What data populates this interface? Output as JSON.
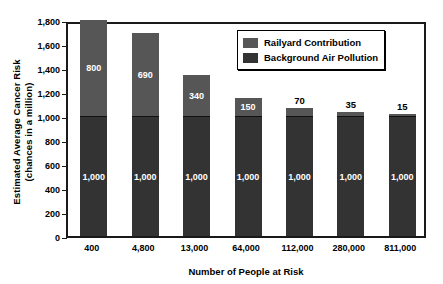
{
  "chart_data": {
    "type": "bar",
    "subtype": "stacked-vertical",
    "title": "",
    "xlabel": "Number of People at Risk",
    "ylabel": "Estimated Average Cancer Risk (chances in a million)",
    "ylabel_line1": "Estimated Average Cancer Risk",
    "ylabel_line2": "(chances in a million)",
    "categories": [
      "400",
      "4,800",
      "13,000",
      "64,000",
      "112,000",
      "280,000",
      "811,000"
    ],
    "ylim": [
      0,
      1800
    ],
    "yticks": [
      0,
      200,
      400,
      600,
      800,
      1000,
      1200,
      1400,
      1600,
      1800
    ],
    "ytick_labels": [
      "0",
      "200",
      "400",
      "600",
      "800",
      "1,000",
      "1,200",
      "1,400",
      "1,600",
      "1,800"
    ],
    "grid": false,
    "legend_position": "top-right",
    "series": [
      {
        "name": "Background Air Pollution",
        "color": "#333333",
        "values": [
          1000,
          1000,
          1000,
          1000,
          1000,
          1000,
          1000
        ],
        "labels": [
          "1,000",
          "1,000",
          "1,000",
          "1,000",
          "1,000",
          "1,000",
          "1,000"
        ],
        "label_color": "#ffffff",
        "label_placement": "inside"
      },
      {
        "name": "Railyard Contribution",
        "color": "#565656",
        "values": [
          800,
          690,
          340,
          150,
          70,
          35,
          15
        ],
        "labels": [
          "800",
          "690",
          "340",
          "150",
          "70",
          "35",
          "15"
        ],
        "label_placement": [
          "inside",
          "inside",
          "inside",
          "inside",
          "outside",
          "outside",
          "outside"
        ]
      }
    ],
    "totals": [
      1800,
      1690,
      1340,
      1150,
      1070,
      1035,
      1015
    ]
  },
  "legend": {
    "items": [
      {
        "label": "Railyard Contribution",
        "color": "#565656"
      },
      {
        "label": "Background Air Pollution",
        "color": "#333333"
      }
    ]
  }
}
